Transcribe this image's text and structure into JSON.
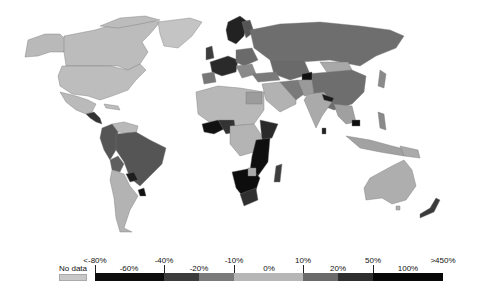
{
  "map": {
    "title": "World map — percentage change",
    "colors": {
      "no_data": "#c8c8c8",
      "lt_m80": "#0c0c0c",
      "m80_m40": "#1a1a1a",
      "m40_m20": "#4a4a4a",
      "m20_m10": "#777777",
      "m10_10": "#b4b4b4",
      "p10_20": "#6e6e6e",
      "p20_50": "#3a3a3a",
      "p50_450": "#0a0a0a",
      "land_default": "#bdbdbd",
      "ocean": "#ffffff"
    }
  },
  "legend": {
    "no_data_label": "No data",
    "top_labels": [
      "<-80%",
      "-40%",
      "-10%",
      "10%",
      "50%",
      ">450%"
    ],
    "bottom_labels": [
      "-60%",
      "-20%",
      "0%",
      "20%",
      "100%"
    ],
    "segments": [
      {
        "range": "<-80% to -40%",
        "color": "#0d0d0d"
      },
      {
        "range": "-40% to -20%",
        "color": "#3c3c3c"
      },
      {
        "range": "-20% to -10%",
        "color": "#7a7a7a"
      },
      {
        "range": "-10% to 10%",
        "color": "#b6b6b6"
      },
      {
        "range": "10% to 20%",
        "color": "#6a6a6a"
      },
      {
        "range": "20% to 50%",
        "color": "#2e2e2e"
      },
      {
        "range": "50% to >450%",
        "color": "#080808"
      }
    ]
  }
}
